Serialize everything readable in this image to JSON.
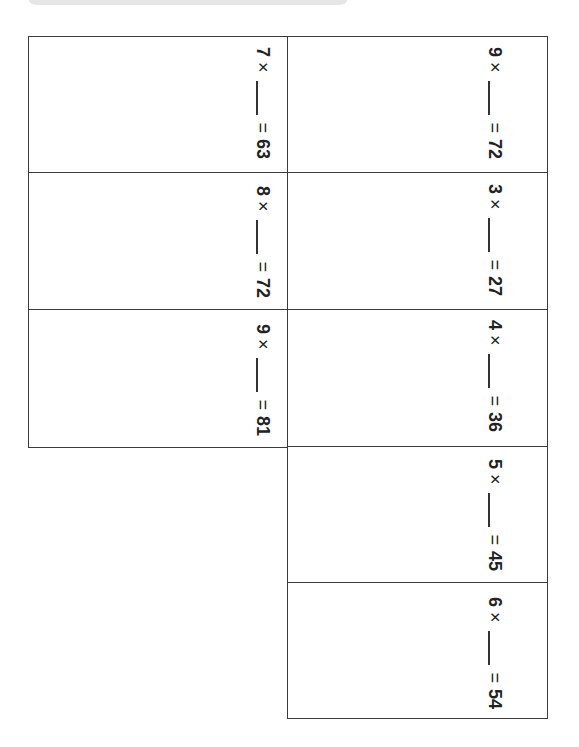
{
  "worksheet": {
    "text_orientation": "rotated-90deg-clockwise",
    "left_column": [
      {
        "factor": "7",
        "times": "×",
        "equals": "=",
        "product": "63"
      },
      {
        "factor": "8",
        "times": "×",
        "equals": "=",
        "product": "72"
      },
      {
        "factor": "9",
        "times": "×",
        "equals": "=",
        "product": "81"
      }
    ],
    "right_column": [
      {
        "factor": "9",
        "times": "×",
        "equals": "=",
        "product": "72"
      },
      {
        "factor": "3",
        "times": "×",
        "equals": "=",
        "product": "27"
      },
      {
        "factor": "4",
        "times": "×",
        "equals": "=",
        "product": "36"
      },
      {
        "factor": "5",
        "times": "×",
        "equals": "=",
        "product": "45"
      },
      {
        "factor": "6",
        "times": "×",
        "equals": "=",
        "product": "54"
      }
    ]
  },
  "colors": {
    "border": "#3a3a3a",
    "top_bar": "#e6e6e6"
  }
}
